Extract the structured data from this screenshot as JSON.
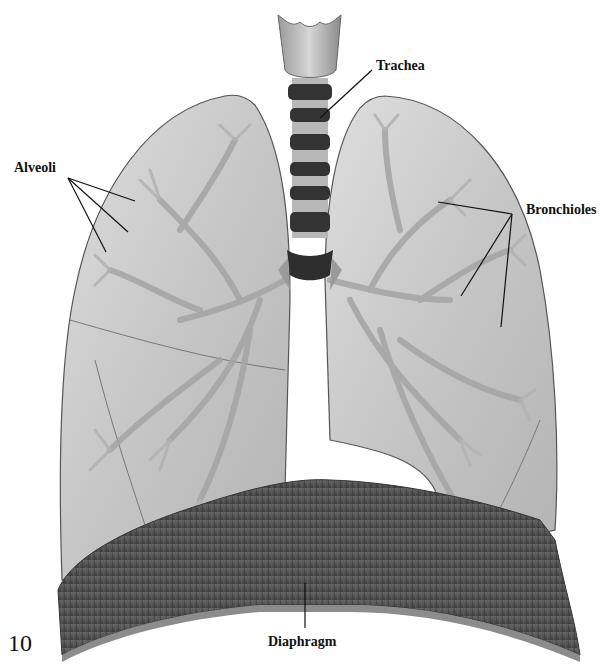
{
  "figure": {
    "number": "10",
    "style": "grayscale illustration"
  },
  "labels": {
    "trachea": "Trachea",
    "alveoli": "Alveoli",
    "bronchioles": "Bronchioles",
    "diaphragm": "Diaphragm"
  },
  "colors": {
    "background": "#ffffff",
    "lung_fill": "#c9c9c9",
    "lung_inner": "#dcdcdc",
    "bronchi": "#a9a9a9",
    "trachea_dark": "#3a3a3a",
    "trachea_light": "#bdbdbd",
    "diaphragm": "#4a4a4a",
    "diaphragm_rim": "#8c8c8c",
    "leader_line": "#111111"
  }
}
